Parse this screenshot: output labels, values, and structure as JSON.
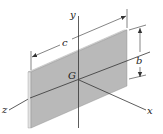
{
  "figure": {
    "labels": {
      "y_axis": "y",
      "x_axis": "x",
      "z_axis": "z",
      "centroid": "G",
      "length_dim": "c",
      "height_dim": "b"
    },
    "colors": {
      "plate_face": "#b9b9b9",
      "plate_edge": "#dcdcdc",
      "lines": "#333333"
    }
  }
}
